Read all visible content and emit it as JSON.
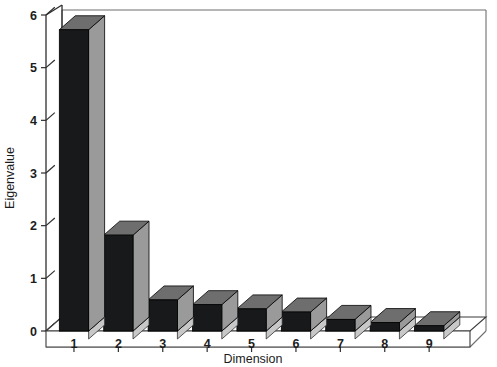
{
  "chart_data": {
    "type": "bar",
    "title": "",
    "subtitle": "",
    "xlabel": "Dimension",
    "ylabel": "Eigenvalue",
    "categories": [
      "1",
      "2",
      "3",
      "4",
      "5",
      "6",
      "7",
      "8",
      "9"
    ],
    "values": [
      5.72,
      1.82,
      0.59,
      0.5,
      0.42,
      0.36,
      0.22,
      0.16,
      0.1
    ],
    "series": [
      {
        "name": "Eigenvalue",
        "values": [
          5.72,
          1.82,
          0.59,
          0.5,
          0.42,
          0.36,
          0.22,
          0.16,
          0.1
        ]
      }
    ],
    "ylim": [
      0,
      6
    ],
    "xlim": [
      0.5,
      9.5
    ],
    "yticks": [
      "0",
      "1",
      "2",
      "3",
      "4",
      "5",
      "6"
    ],
    "ytick_values": [
      0,
      1,
      2,
      3,
      4,
      5,
      6
    ],
    "xticks": [
      "1",
      "2",
      "3",
      "4",
      "5",
      "6",
      "7",
      "8",
      "9"
    ],
    "grid": false,
    "legend": false,
    "legend_position": "none",
    "style": "3d-bars",
    "colors": {
      "bar_front": "#17191a",
      "bar_side": "#9a9a9a",
      "bar_top": "#6e6e6e",
      "axis": "#2e2e2e",
      "frame": "#6f6f6f",
      "background": "#ffffff",
      "text": "#1c1c1c"
    },
    "annotations": []
  }
}
